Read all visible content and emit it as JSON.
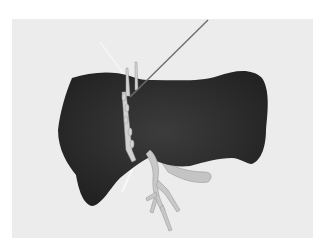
{
  "scene": {
    "description": "3D rendering of a liver with vessels and a puncture needle",
    "colors": {
      "page_background": "#ffffff",
      "panel_background": "#ececec",
      "organ": "#2a2a2a",
      "organ_highlight": "#3a3a3a",
      "vessel": "#c8c8c8",
      "needle": "#6a6a6a",
      "guide_line": "#f4f4f4"
    }
  }
}
